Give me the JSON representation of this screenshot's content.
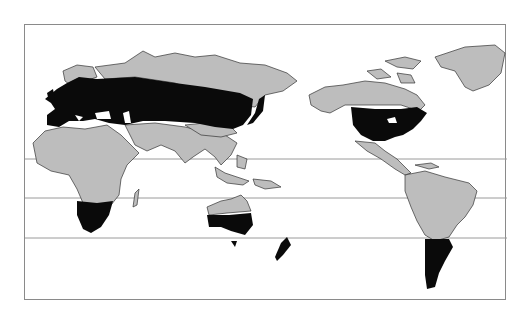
{
  "figure": {
    "clipped_caption": "",
    "projection": "Pacific-centered world map",
    "legend": {
      "shaded_region": "temperate zones (black)",
      "land": "other land (gray)",
      "ocean": "white"
    },
    "colors": {
      "frame": "#8a8a8a",
      "land": "#bdbdbd",
      "highlight": "#0a0a0a",
      "border": "#333333",
      "ocean": "#ffffff",
      "latitude_line": "#9a9a9a"
    },
    "latitude_lines_y": [
      134,
      173,
      213
    ],
    "highlighted_regions": [
      "Europe and northern Asia",
      "United States",
      "Southern Africa",
      "Southern Australia",
      "Southern South America",
      "New Zealand"
    ]
  }
}
